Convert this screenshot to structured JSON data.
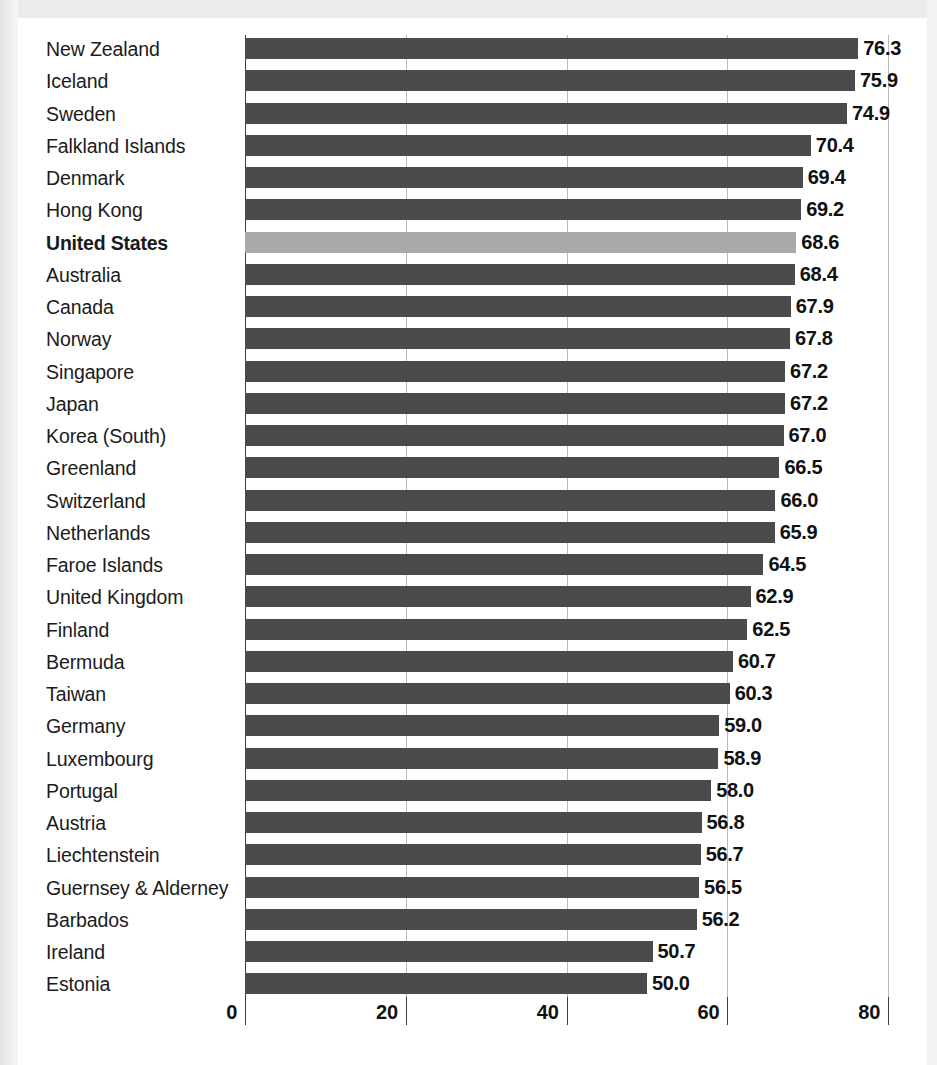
{
  "chart_data": {
    "type": "bar",
    "orientation": "horizontal",
    "title": "",
    "subtitle": "",
    "xlabel": "",
    "ylabel": "",
    "xlim": [
      0,
      80
    ],
    "xticks": [
      0,
      20,
      40,
      60,
      80
    ],
    "xtick_labels": [
      "0",
      "20",
      "40",
      "60",
      "80"
    ],
    "grid": true,
    "grid_axis": "x",
    "legend": null,
    "highlight_category": "United States",
    "colors": {
      "bar": "#4b4b4b",
      "bar_highlight": "#a9a9a9",
      "gridline": "#b9b9b9",
      "axis": "#3d3d3d",
      "text": "#111111",
      "background": "#ffffff",
      "frame": "#ebebeb"
    },
    "categories": [
      "New Zealand",
      "Iceland",
      "Sweden",
      "Falkland Islands",
      "Denmark",
      "Hong Kong",
      "United States",
      "Australia",
      "Canada",
      "Norway",
      "Singapore",
      "Japan",
      "Korea (South)",
      "Greenland",
      "Switzerland",
      "Netherlands",
      "Faroe Islands",
      "United Kingdom",
      "Finland",
      "Bermuda",
      "Taiwan",
      "Germany",
      "Luxembourg",
      "Portugal",
      "Austria",
      "Liechtenstein",
      "Guernsey & Alderney",
      "Barbados",
      "Ireland",
      "Estonia"
    ],
    "values": [
      76.3,
      75.9,
      74.9,
      70.4,
      69.4,
      69.2,
      68.6,
      68.4,
      67.9,
      67.8,
      67.2,
      67.2,
      67.0,
      66.5,
      66.0,
      65.9,
      64.5,
      62.9,
      62.5,
      60.7,
      60.3,
      59.0,
      58.9,
      58.0,
      56.8,
      56.7,
      56.5,
      56.2,
      50.7,
      50.0
    ],
    "value_labels": [
      "76.3",
      "75.9",
      "74.9",
      "70.4",
      "69.4",
      "69.2",
      "68.6",
      "68.4",
      "67.9",
      "67.8",
      "67.2",
      "67.2",
      "67.0",
      "66.5",
      "66.0",
      "65.9",
      "64.5",
      "62.9",
      "62.5",
      "60.7",
      "60.3",
      "59.0",
      "58.9",
      "58.0",
      "56.8",
      "56.7",
      "56.5",
      "56.2",
      "50.7",
      "50.0"
    ]
  }
}
